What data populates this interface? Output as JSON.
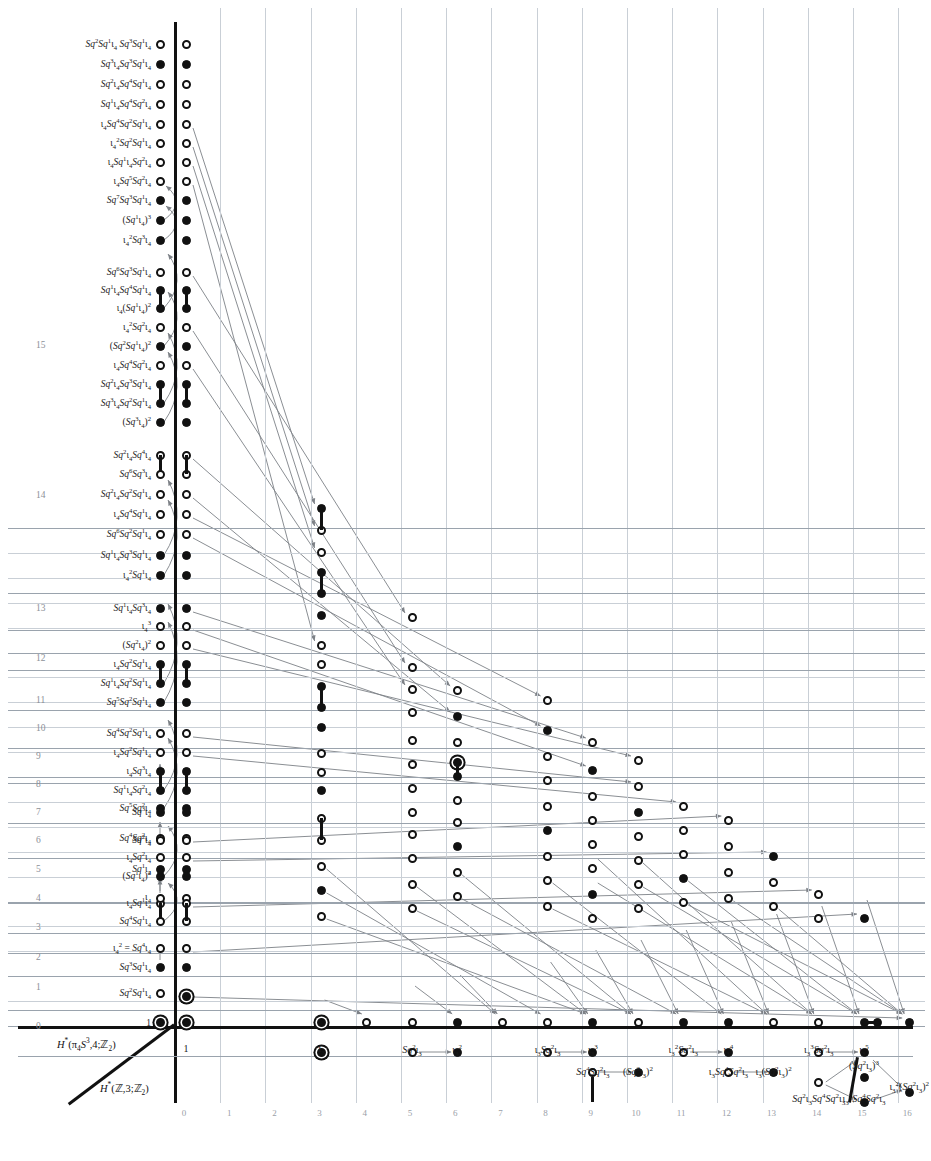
{
  "figure": {
    "type": "adams-spectral-sequence-chart",
    "axis_labels": {
      "upper": "H*(π4S³,4;ℤ2)",
      "lower": "H*(ℤ,3;ℤ2)"
    },
    "x_ticks": [
      "0",
      "1",
      "2",
      "3",
      "4",
      "5",
      "6",
      "7",
      "8",
      "9",
      "10",
      "11",
      "12",
      "13",
      "14",
      "15",
      "16"
    ],
    "y_ticks_shown": [
      "0",
      "1",
      "2",
      "3",
      "4",
      "5",
      "6",
      "7",
      "8",
      "9",
      "10",
      "11",
      "12",
      "13",
      "14",
      "15"
    ],
    "integer_label": "ℤ",
    "x_range": [
      0,
      16
    ],
    "y_range": [
      0,
      19
    ]
  },
  "base_row_labels": [
    {
      "x": 0,
      "text": "1"
    },
    {
      "x": 3,
      "text": "ι3"
    },
    {
      "x": 5,
      "text": "Sq²ι3"
    },
    {
      "x": 6,
      "text": "ι3²"
    },
    {
      "x": 8,
      "text": "ι3Sq²ι3"
    },
    {
      "x": 9,
      "text": "ι3³"
    },
    {
      "x": 9,
      "text": "Sq⁴Sq²ι3",
      "row": 2
    },
    {
      "x": 10,
      "text": "(Sq²ι3)²",
      "row": 2
    },
    {
      "x": 11,
      "text": "ι3²Sq²ι3"
    },
    {
      "x": 12,
      "text": "ι3⁴"
    },
    {
      "x": 12,
      "text": "ι3Sq⁴Sq²ι3",
      "row": 2
    },
    {
      "x": 13,
      "text": "ι3(Sq²ι3)²",
      "row": 2
    },
    {
      "x": 14,
      "text": "ι3³Sq²ι3"
    },
    {
      "x": 15,
      "text": "ι3⁵"
    },
    {
      "x": 14,
      "text": "Sq²ι3Sq⁴Sq²ι3",
      "row": 2
    },
    {
      "x": 15,
      "text": "(Sq²ι3)³",
      "row": 2
    },
    {
      "x": 15,
      "text": "ι3²Sq⁴Sq²ι3",
      "row": 3
    },
    {
      "x": 16,
      "text": "ι3²(Sq²ι3)²",
      "row": 3
    }
  ],
  "left_column_labels": [
    {
      "y": 19.0,
      "text": "Sq²Sq¹ι4 Sq³Sq¹ι4",
      "dot": "open"
    },
    {
      "y": 18.5,
      "text": "Sq³ι4Sq³Sq¹ι4",
      "dot": "filled"
    },
    {
      "y": 18.0,
      "text": "Sq²ι4Sq⁴Sq¹ι4",
      "dot": "open"
    },
    {
      "y": 17.5,
      "text": "Sq¹ι4Sq⁴Sq²ι4",
      "dot": "open"
    },
    {
      "y": 17.0,
      "text": "ι4Sq⁴Sq²Sq¹ι4",
      "dot": "open"
    },
    {
      "y": 16.6,
      "text": "ι4²Sq²Sq¹ι4",
      "dot": "open"
    },
    {
      "y": 16.2,
      "text": "ι4Sq¹ι4Sq²ι4",
      "dot": "open"
    },
    {
      "y": 15.8,
      "text": "ι4Sq⁵Sq²ι4",
      "dot": "open"
    },
    {
      "y": 15.4,
      "text": "Sq⁷Sq³Sq¹ι4",
      "dot": "filled"
    },
    {
      "y": 15.0,
      "text": "(Sq¹ι4)³",
      "dot": "filled"
    },
    {
      "y": 14.6,
      "text": "ι4²Sq³ι4",
      "dot": "filled"
    },
    {
      "y": 14.1,
      "text": "Sq⁶Sq³Sq¹ι4",
      "dot": "open"
    },
    {
      "y": 13.7,
      "text": "Sq¹ι4Sq⁴Sq¹ι4",
      "dot": "filled"
    },
    {
      "y": 13.3,
      "text": "ι4(Sq¹ι4)²",
      "dot": "filled"
    },
    {
      "y": 12.9,
      "text": "ι4²Sq²ι4",
      "dot": "open"
    },
    {
      "y": 12.5,
      "text": "(Sq²Sq¹ι4)²",
      "dot": "filled"
    },
    {
      "y": 12.1,
      "text": "ι4Sq⁴Sq²ι4",
      "dot": "open"
    },
    {
      "y": 11.7,
      "text": "Sq²ι4Sq³Sq¹ι4",
      "dot": "filled"
    },
    {
      "y": 11.3,
      "text": "Sq³ι4Sq²Sq¹ι4",
      "dot": "filled"
    },
    {
      "y": 10.9,
      "text": "(Sq³ι4)²",
      "dot": "filled"
    },
    {
      "y": 10.3,
      "text": "Sq²ι4Sq⁴ι4",
      "dot": "open"
    },
    {
      "y": 9.9,
      "text": "Sq⁶Sq³ι4",
      "dot": "open"
    },
    {
      "y": 9.5,
      "text": "Sq²ι4Sq²Sq¹ι4",
      "dot": "open"
    },
    {
      "y": 9.1,
      "text": "ι4Sq⁴Sq¹ι4",
      "dot": "open"
    },
    {
      "y": 8.7,
      "text": "Sq⁶Sq²Sq¹ι4",
      "dot": "open"
    },
    {
      "y": 8.3,
      "text": "Sq¹ι4Sq³Sq¹ι4",
      "dot": "filled"
    },
    {
      "y": 7.9,
      "text": "ι4²Sq¹ι4",
      "dot": "filled"
    },
    {
      "y": 7.3,
      "text": "Sq¹ι4Sq³ι4",
      "dot": "filled"
    },
    {
      "y": 6.9,
      "text": "ι4³",
      "dot": "open"
    },
    {
      "y": 6.5,
      "text": "(Sq²ι4)²",
      "dot": "open"
    },
    {
      "y": 6.1,
      "text": "ι4Sq²Sq¹ι4",
      "dot": "filled"
    },
    {
      "y": 5.7,
      "text": "Sq¹ι4Sq²Sq¹ι4",
      "dot": "filled"
    },
    {
      "y": 5.3,
      "text": "Sq⁵Sq²Sq¹ι4",
      "dot": "filled"
    },
    {
      "y": 4.7,
      "text": "Sq⁴Sq²Sq¹ι4",
      "dot": "open"
    },
    {
      "y": 4.3,
      "text": "ι4Sq²Sq¹ι4",
      "dot": "open"
    },
    {
      "y": 3.9,
      "text": "ι4Sq³ι4",
      "dot": "filled"
    },
    {
      "y": 3.5,
      "text": "Sq¹ι4Sq²ι4",
      "dot": "filled"
    },
    {
      "y": 3.1,
      "text": "Sq⁵Sq²ι4",
      "dot": "filled"
    },
    {
      "y": 2.6,
      "text": "Sq⁴Sq²ι4",
      "dot": "open"
    },
    {
      "y": 2.2,
      "text": "ι4Sq²ι4",
      "dot": "open"
    },
    {
      "y": 1.8,
      "text": "(Sq¹ι4)²",
      "dot": "filled"
    },
    {
      "y": 1.3,
      "text": "ι4Sq¹ι4",
      "dot": "open"
    },
    {
      "y": 0.9,
      "text": "Sq⁴Sq¹ι4",
      "dot": "open"
    },
    {
      "y": 0.4,
      "text": "ι4² = Sq⁴ι4",
      "dot": "open"
    },
    {
      "y": 0.0,
      "text": "Sq³Sq¹ι4",
      "dot": "filled"
    },
    {
      "y": -0.5,
      "text": "Sq²Sq¹ι4",
      "dot": "open"
    },
    {
      "y": -0.9,
      "text": "Sq³ι4",
      "dot": "filled"
    },
    {
      "y": -1.4,
      "text": "Sq²ι4",
      "dot": "open"
    },
    {
      "y": -1.9,
      "text": "Sq¹ι4",
      "dot": "filled"
    },
    {
      "y": -2.4,
      "text": "ι4",
      "dot": "open"
    },
    {
      "y": -3.9,
      "text": "1",
      "dot": "ring"
    }
  ],
  "chart_data": {
    "type": "scatter",
    "title": "",
    "xlabel": "total degree",
    "ylabel": "filtration",
    "markers": {
      "open": "open circle (Z/2 class)",
      "filled": "filled circle",
      "ring": "ringed circle (Z class)"
    }
  }
}
